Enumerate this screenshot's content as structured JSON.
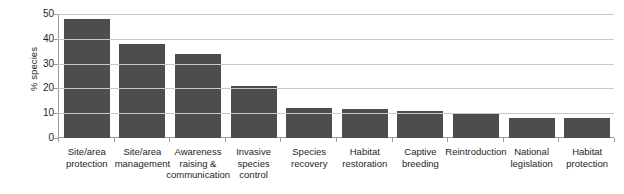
{
  "chart_data": {
    "type": "bar",
    "title": "",
    "xlabel": "",
    "ylabel": "% species",
    "ylim": [
      0,
      50
    ],
    "yticks": [
      0,
      10,
      20,
      30,
      40,
      50
    ],
    "ytick_labels": [
      "0",
      "10",
      "20",
      "30",
      "40",
      "50"
    ],
    "grid": "horizontal",
    "legend": "none",
    "bar_color": "#4d4d4d",
    "categories": [
      "Site/area protection",
      "Site/area management",
      "Awareness raising & communication",
      "Invasive species control",
      "Species recovery",
      "Habitat restoration",
      "Captive breeding",
      "Reintroduction",
      "National legislation",
      "Habitat protection"
    ],
    "category_lines": [
      [
        "Site/area",
        "protection"
      ],
      [
        "Site/area",
        "management"
      ],
      [
        "Awareness",
        "raising &",
        "communication"
      ],
      [
        "Invasive",
        "species",
        "control"
      ],
      [
        "Species",
        "recovery"
      ],
      [
        "Habitat",
        "restoration"
      ],
      [
        "Captive",
        "breeding"
      ],
      [
        "Reintroduction"
      ],
      [
        "National",
        "legislation"
      ],
      [
        "Habitat",
        "protection"
      ]
    ],
    "values": [
      48,
      38,
      34,
      21,
      12,
      11.5,
      11,
      9.5,
      8,
      8
    ]
  }
}
